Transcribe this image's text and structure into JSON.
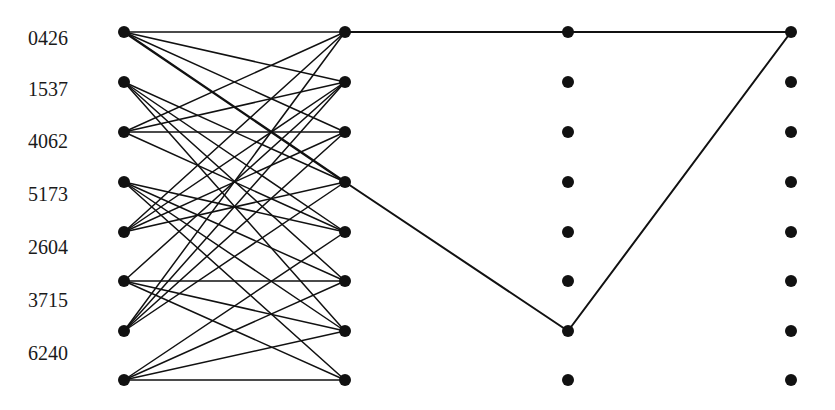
{
  "diagram": {
    "type": "layered-graph",
    "colors": {
      "node": "#111111",
      "edge": "#111111",
      "background": "#ffffff"
    },
    "labels": [
      "0426",
      "1537",
      "4062",
      "5173",
      "2604",
      "3715",
      "6240"
    ],
    "label_y": [
      28,
      79,
      131,
      184,
      237,
      290,
      343
    ],
    "columns_x": [
      124,
      345,
      568,
      791
    ],
    "rows_y": [
      32,
      82,
      132,
      182,
      232,
      281,
      331,
      380
    ],
    "node_radius": 6,
    "bipartite_edges": [
      [
        0,
        0
      ],
      [
        0,
        1
      ],
      [
        0,
        2
      ],
      [
        0,
        3
      ],
      [
        1,
        3
      ],
      [
        1,
        4
      ],
      [
        1,
        5
      ],
      [
        1,
        6
      ],
      [
        2,
        0
      ],
      [
        2,
        1
      ],
      [
        2,
        2
      ],
      [
        2,
        4
      ],
      [
        3,
        4
      ],
      [
        3,
        5
      ],
      [
        3,
        6
      ],
      [
        3,
        7
      ],
      [
        4,
        0
      ],
      [
        4,
        1
      ],
      [
        4,
        2
      ],
      [
        4,
        3
      ],
      [
        5,
        1
      ],
      [
        5,
        5
      ],
      [
        5,
        6
      ],
      [
        5,
        7
      ],
      [
        6,
        0
      ],
      [
        6,
        1
      ],
      [
        6,
        2
      ],
      [
        6,
        3
      ],
      [
        7,
        4
      ],
      [
        7,
        5
      ],
      [
        7,
        6
      ],
      [
        7,
        7
      ]
    ],
    "thick_edges": [
      [
        0,
        3
      ]
    ],
    "path_edges": [
      {
        "from": [
          1,
          0
        ],
        "to": [
          2,
          0
        ]
      },
      {
        "from": [
          2,
          0
        ],
        "to": [
          3,
          0
        ]
      },
      {
        "from": [
          1,
          3
        ],
        "to": [
          2,
          6
        ]
      },
      {
        "from": [
          2,
          6
        ],
        "to": [
          3,
          0
        ]
      }
    ]
  }
}
